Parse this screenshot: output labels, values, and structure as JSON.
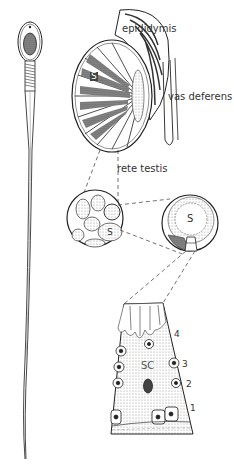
{
  "figure": {
    "labels": {
      "epididymis": "epididymis",
      "vas_deferens": "vas deferens",
      "rete_testis": "rete testis",
      "s_tubule": "S",
      "s_cross_section": "S",
      "s_magnified": "S",
      "sertoli_cell": "SC",
      "layer_1": "1",
      "layer_2": "2",
      "layer_3": "3",
      "layer_4": "4"
    },
    "colors": {
      "ink": "#222222",
      "stipple": "#b0b0b0",
      "dark_fill": "#555555",
      "background": "#ffffff"
    }
  }
}
